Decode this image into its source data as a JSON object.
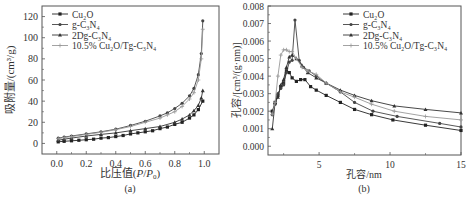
{
  "chart_data": [
    {
      "type": "line",
      "panel_label": "(a)",
      "title": "",
      "xlabel": "比压值(P/P0)",
      "ylabel": "吸附量/(cm³/g)",
      "xlim": [
        -0.1,
        1.1
      ],
      "ylim": [
        -10,
        130
      ],
      "xticks": [
        0.0,
        0.2,
        0.4,
        0.6,
        0.8,
        1.0
      ],
      "xtick_labels": [
        "0.0",
        "0.2",
        "0.4",
        "0.6",
        "0.8",
        "1.0"
      ],
      "yticks": [
        0,
        20,
        40,
        60,
        80,
        100,
        120
      ],
      "ytick_labels": [
        "0",
        "20",
        "40",
        "60",
        "80",
        "100",
        "120"
      ],
      "grid": false,
      "legend_position": "upper left",
      "series": [
        {
          "name": "Cu2O",
          "label_html": "Cu<sub>2</sub>O",
          "color": "#222222",
          "marker": "square",
          "x": [
            0.01,
            0.05,
            0.1,
            0.15,
            0.2,
            0.25,
            0.3,
            0.35,
            0.4,
            0.45,
            0.5,
            0.55,
            0.6,
            0.65,
            0.7,
            0.75,
            0.8,
            0.85,
            0.9,
            0.93,
            0.96,
            0.99
          ],
          "y": [
            1.5,
            2,
            2.5,
            3,
            3.5,
            4,
            5,
            5.5,
            6.5,
            7.5,
            9,
            10,
            11,
            12,
            14,
            15.5,
            18,
            20,
            24,
            27,
            32,
            40
          ]
        },
        {
          "name": "g-C3N4",
          "color": "#444444",
          "marker": "circle",
          "x": [
            0.01,
            0.05,
            0.1,
            0.2,
            0.3,
            0.4,
            0.5,
            0.6,
            0.7,
            0.75,
            0.8,
            0.85,
            0.9,
            0.93,
            0.96,
            0.98,
            0.99
          ],
          "y": [
            5,
            6,
            7,
            9,
            11,
            13.5,
            17,
            21,
            26,
            29,
            33,
            38,
            45,
            52,
            65,
            85,
            116
          ]
        },
        {
          "name": "2Dg-C3N4",
          "color": "#333333",
          "marker": "triangle",
          "x": [
            0.01,
            0.05,
            0.1,
            0.2,
            0.3,
            0.4,
            0.5,
            0.6,
            0.7,
            0.8,
            0.85,
            0.9,
            0.93,
            0.96,
            0.98,
            0.99
          ],
          "y": [
            3,
            4,
            5,
            7,
            8.5,
            10,
            12,
            14,
            16,
            20,
            23,
            27,
            31,
            36,
            43,
            50
          ]
        },
        {
          "name": "10.5% Cu2O/Tg-C3N4",
          "label_html": "10.5% Cu<sub>2</sub>O/Tg-C<sub>3</sub>N<sub>4</sub>",
          "color": "#999999",
          "marker": "plus",
          "x": [
            0.01,
            0.05,
            0.1,
            0.2,
            0.3,
            0.4,
            0.5,
            0.6,
            0.7,
            0.75,
            0.8,
            0.85,
            0.9,
            0.93,
            0.96,
            0.98,
            0.99
          ],
          "y": [
            4.5,
            5.5,
            6.5,
            8.5,
            10.5,
            13,
            16,
            20,
            24,
            27,
            30,
            35,
            42,
            48,
            60,
            80,
            108
          ]
        }
      ]
    },
    {
      "type": "line",
      "panel_label": "(b)",
      "title": "",
      "xlabel": "孔容/nm",
      "ylabel": "孔容/[cm³/(g·nm)]",
      "xlim": [
        1.4,
        15
      ],
      "ylim": [
        -0.0005,
        0.008
      ],
      "xticks": [
        5,
        10,
        15
      ],
      "xtick_labels": [
        "5",
        "10",
        "15"
      ],
      "yticks": [
        0.0,
        0.001,
        0.002,
        0.003,
        0.004,
        0.005,
        0.006,
        0.007,
        0.008
      ],
      "ytick_labels": [
        "0.000",
        "0.001",
        "0.002",
        "0.003",
        "0.004",
        "0.005",
        "0.006",
        "0.007",
        "0.008"
      ],
      "grid": false,
      "legend_position": "upper right",
      "series": [
        {
          "name": "Cu2O",
          "color": "#222222",
          "marker": "square",
          "x": [
            1.7,
            1.9,
            2.1,
            2.3,
            2.5,
            2.7,
            2.9,
            3.1,
            3.4,
            3.7,
            4.0,
            4.4,
            4.8,
            5.5,
            6.5,
            7.5,
            8.7,
            10.2,
            12.5,
            15
          ],
          "y": [
            0.002,
            0.0025,
            0.0029,
            0.0034,
            0.0036,
            0.0043,
            0.0042,
            0.0039,
            0.0037,
            0.0038,
            0.0038,
            0.0034,
            0.0032,
            0.0029,
            0.0025,
            0.0021,
            0.0018,
            0.0015,
            0.0012,
            0.0009
          ]
        },
        {
          "name": "g-C3N4",
          "color": "#444444",
          "marker": "circle",
          "x": [
            1.7,
            1.9,
            2.1,
            2.3,
            2.5,
            2.7,
            2.9,
            3.1,
            3.3,
            3.6,
            3.9,
            4.3,
            4.8,
            5.5,
            6.5,
            7.5,
            8.8,
            10.5,
            13.5,
            15
          ],
          "y": [
            0.0018,
            0.0024,
            0.003,
            0.0033,
            0.0035,
            0.0042,
            0.0048,
            0.0049,
            0.0072,
            0.0049,
            0.0045,
            0.0043,
            0.004,
            0.0036,
            0.0031,
            0.0025,
            0.002,
            0.0017,
            0.0013,
            0.0011
          ]
        },
        {
          "name": "2Dg-C3N4",
          "color": "#333333",
          "marker": "triangle",
          "x": [
            1.7,
            1.9,
            2.1,
            2.3,
            2.5,
            2.7,
            2.9,
            3.1,
            3.4,
            3.8,
            4.2,
            4.8,
            5.5,
            6.5,
            7.5,
            8.7,
            10.3,
            12.5,
            15
          ],
          "y": [
            0.001,
            0.0025,
            0.0028,
            0.0035,
            0.0038,
            0.0045,
            0.0051,
            0.0052,
            0.005,
            0.0046,
            0.0042,
            0.0039,
            0.0036,
            0.0032,
            0.0029,
            0.0026,
            0.0023,
            0.0021,
            0.0019
          ]
        },
        {
          "name": "10.5% Cu2O/Tg-C3N4",
          "color": "#999999",
          "marker": "plus",
          "x": [
            1.7,
            1.9,
            2.1,
            2.3,
            2.5,
            2.7,
            2.9,
            3.1,
            3.4,
            3.8,
            4.2,
            4.8,
            5.5,
            6.5,
            7.5,
            8.7,
            10.3,
            12.5,
            15
          ],
          "y": [
            0.0018,
            0.0025,
            0.004,
            0.0052,
            0.0055,
            0.0055,
            0.0054,
            0.0054,
            0.005,
            0.0045,
            0.0043,
            0.0041,
            0.0036,
            0.0031,
            0.0028,
            0.0024,
            0.002,
            0.0017,
            0.0015
          ]
        }
      ]
    }
  ],
  "figure": {
    "panel_a": {
      "label": "(a)",
      "xlabel_prefix": "比压值(",
      "xlabel_var": "P",
      "xlabel_sep": "/",
      "xlabel_var2": "P",
      "xlabel_sub": "0",
      "xlabel_suffix": ")",
      "ylabel": "吸附量/(cm³/g)"
    },
    "panel_b": {
      "label": "(b)",
      "xlabel": "孔容/nm",
      "ylabel": "孔容/[cm³/(g·nm)]"
    },
    "legend": [
      "Cu₂O",
      "g-C₃N₄",
      "2Dg-C₃N₄",
      "10.5% Cu₂O/Tg-C₃N₄"
    ]
  }
}
